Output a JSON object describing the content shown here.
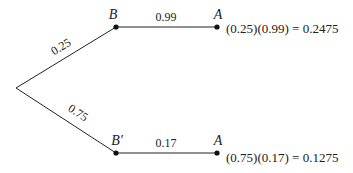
{
  "diagram": {
    "type": "probability-tree",
    "branches": [
      {
        "first": {
          "node": "B",
          "prob": "0.25"
        },
        "second": {
          "node": "A",
          "prob": "0.99"
        },
        "result": "(0.25)(0.99) = 0.2475"
      },
      {
        "first": {
          "node": "B′",
          "prob": "0.75"
        },
        "second": {
          "node": "A",
          "prob": "0.17"
        },
        "result": "(0.75)(0.17) = 0.1275"
      }
    ]
  }
}
